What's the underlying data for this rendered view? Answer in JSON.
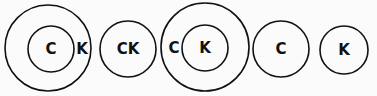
{
  "diagram": {
    "title": "",
    "groups": [
      {
        "id": "g1",
        "description": "C inside circle nested within larger circle containing K",
        "labels": [
          "C",
          "K"
        ]
      },
      {
        "id": "g2",
        "description": "single circle containing C and K",
        "labels": [
          "CK"
        ]
      },
      {
        "id": "g3",
        "description": "K inside circle nested within larger circle containing C",
        "labels": [
          "C",
          "K"
        ]
      },
      {
        "id": "g4",
        "description": "single circle containing C",
        "labels": [
          "C"
        ]
      },
      {
        "id": "g5",
        "description": "single circle containing K",
        "labels": [
          "K"
        ]
      }
    ]
  }
}
